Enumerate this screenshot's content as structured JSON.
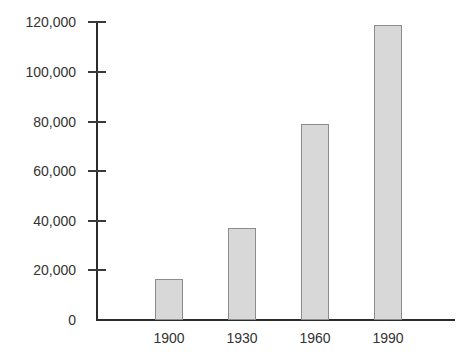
{
  "chart_data": {
    "type": "bar",
    "title": "",
    "xlabel": "",
    "ylabel": "",
    "categories": [
      "1900",
      "1930",
      "1960",
      "1990"
    ],
    "values": [
      16500,
      37000,
      79000,
      118800
    ],
    "ylim": [
      0,
      120000
    ],
    "yticks": [
      0,
      20000,
      40000,
      60000,
      80000,
      100000,
      120000
    ],
    "ytick_labels": [
      "0",
      "20,000",
      "40,000",
      "60,000",
      "80,000",
      "100,000",
      "120,000"
    ],
    "grid": false,
    "legend": null,
    "series": [
      {
        "name": "",
        "values": [
          16500,
          37000,
          79000,
          118800
        ]
      }
    ],
    "colors": {
      "bar_fill": "#d8d8d8",
      "bar_border": "#8c8c8c",
      "axis": "#2b2b2b",
      "text": "#333333"
    }
  }
}
